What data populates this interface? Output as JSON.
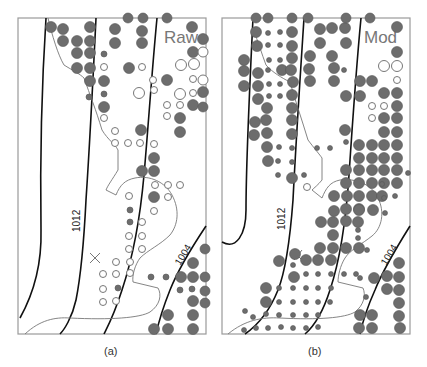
{
  "panels": [
    {
      "id": "a",
      "label": "Raw",
      "caption": "(a)",
      "isobar_labels": [
        "1012",
        "1004"
      ]
    },
    {
      "id": "b",
      "label": "Mod",
      "caption": "(b)",
      "isobar_labels": [
        "1012",
        "1004"
      ]
    }
  ],
  "colors": {
    "filled_dot": "#6d6d6d",
    "open_dot_stroke": "#777777",
    "isobar": "#111111",
    "frame": "#9a9a9a",
    "panel_label": "#777777"
  }
}
